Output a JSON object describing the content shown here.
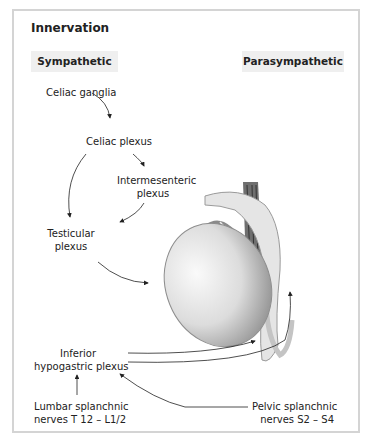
{
  "title": "Innervation",
  "headers": {
    "sympathetic": "Sympathetic",
    "parasympathetic": "Parasympathetic"
  },
  "labels": {
    "celiac_ganglia": "Celiac ganglia",
    "celiac_plexus": "Celiac plexus",
    "intermesenteric_1": "Intermesenteric",
    "intermesenteric_2": "plexus",
    "testicular_1": "Testicular",
    "testicular_2": "plexus",
    "inferior_1": "Inferior",
    "inferior_2": "hypogastric plexus",
    "lumbar_1": "Lumbar splanchnic",
    "lumbar_2": "nerves T 12 – L1/2",
    "pelvic_1": "Pelvic splanchnic",
    "pelvic_2": "nerves S2 – S4"
  }
}
